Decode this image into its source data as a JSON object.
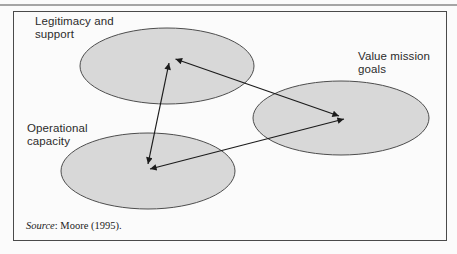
{
  "figure": {
    "nodes": [
      {
        "id": "legitimacy-support",
        "lines": [
          "Legitimacy and",
          "support"
        ]
      },
      {
        "id": "value-mission-goals",
        "lines": [
          "Value mission",
          "goals"
        ]
      },
      {
        "id": "operational-capacity",
        "lines": [
          "Operational",
          "capacity"
        ]
      }
    ],
    "edges": [
      {
        "from": "legitimacy-support",
        "to": "operational-capacity",
        "style": "double-arrow"
      },
      {
        "from": "legitimacy-support",
        "to": "value-mission-goals",
        "style": "double-arrow"
      },
      {
        "from": "operational-capacity",
        "to": "value-mission-goals",
        "style": "double-arrow"
      }
    ],
    "source": {
      "label": "Source",
      "text": ": Moore (1995)."
    },
    "colors": {
      "ellipse_fill": "#d8d8d8",
      "ellipse_stroke": "#4d4d4d",
      "arrow": "#1b1b1b",
      "frame_border": "#4a4a4a",
      "top_rule": "#a5a5a5",
      "label_text": "#2b2b2b",
      "background": "#fbfbfb"
    }
  }
}
